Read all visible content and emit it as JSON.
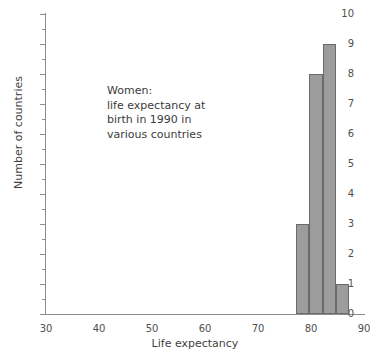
{
  "chart_data": {
    "type": "bar",
    "title": "",
    "subtitle": "",
    "xlabel": "Life expectancy",
    "ylabel": "Number of countries",
    "xlim": [
      30,
      90
    ],
    "ylim": [
      0,
      10
    ],
    "xticks": [
      30,
      40,
      50,
      60,
      70,
      80,
      90
    ],
    "yticks": [
      0,
      1,
      2,
      3,
      4,
      5,
      6,
      7,
      8,
      9,
      10
    ],
    "y_minor_ticks": [
      0.5,
      1.5,
      2.5,
      3.5,
      4.5,
      5.5,
      6.5,
      7.5,
      8.5,
      9.5
    ],
    "grid": false,
    "legend": null,
    "bin_width": 2.5,
    "bin_edges": [
      77.2,
      79.7,
      82.2,
      84.7,
      87.2
    ],
    "categories": [
      "77.2-79.7",
      "79.7-82.2",
      "82.2-84.7",
      "84.7-87.2"
    ],
    "values": [
      3,
      8,
      9,
      1
    ],
    "bar_color": "#9c9c9c",
    "bar_edge_color": "#6b6b6b",
    "axis_color": "#8d8d8d",
    "annotation": {
      "lines": [
        "Women:",
        "life expectancy at",
        "birth in 1990 in",
        "various countries"
      ]
    }
  },
  "axes": {
    "x_title": "Life expectancy",
    "y_title": "Number of countries",
    "x_tick_labels": [
      "30",
      "40",
      "50",
      "60",
      "70",
      "80",
      "90"
    ],
    "y_tick_labels": [
      "0",
      "1",
      "2",
      "3",
      "4",
      "5",
      "6",
      "7",
      "8",
      "9",
      "10"
    ]
  },
  "annotation": {
    "line1": "Women:",
    "line2": "life expectancy at",
    "line3": "birth in 1990 in",
    "line4": "various countries"
  }
}
